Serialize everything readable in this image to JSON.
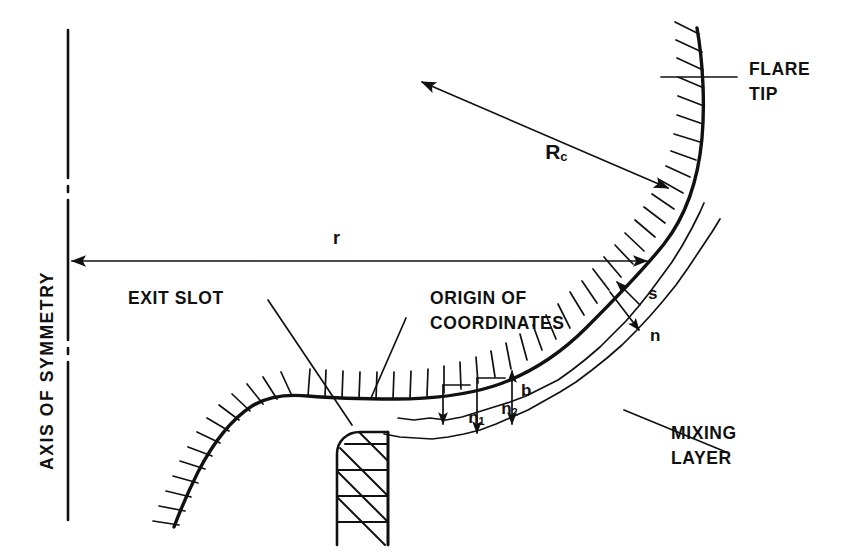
{
  "figure": {
    "kind": "engineering-schematic",
    "background_color": "#ffffff",
    "ink_color": "#111111"
  },
  "labels": {
    "axis_of_symmetry": "AXIS OF SYMMETRY",
    "flare_tip_line1": "FLARE",
    "flare_tip_line2": "TIP",
    "exit_slot": "EXIT SLOT",
    "origin_line1": "ORIGIN OF",
    "origin_line2": "COORDINATES",
    "mixing_layer_line1": "MIXING",
    "mixing_layer_line2": "LAYER",
    "radius_of_curvature": "R",
    "radius_of_curvature_subscript": "c",
    "radial_distance": "r",
    "streamwise_coordinate": "s",
    "normal_coordinate": "n",
    "n1": "n",
    "n1_subscript": "1",
    "n2": "n",
    "n2_subscript": "2",
    "mixing_layer_thickness": "b"
  },
  "geometry": {
    "axis_x": 68,
    "axis_top_y": 30,
    "axis_bottom_y": 520,
    "centerline_gaps": [
      [
        182,
        196
      ],
      [
        344,
        358
      ]
    ],
    "wall_profile": "M 697 28 C 703 62 705 104 702 138 C 698 182 686 216 664 244 C 640 274 612 302 586 328 C 560 354 530 374 494 386 C 462 396 430 399 396 399 C 360 399 330 398 308 396 C 286 394 268 396 252 406 C 232 419 213 443 198 472 C 188 492 180 511 174 527",
    "mixing_layer_upper": "M 398 418 C 432 419 466 415 498 405 C 530 394 562 376 592 352 C 622 327 648 297 668 268 C 684 245 696 222 703 206",
    "mixing_layer_lower": "M 386 434 C 412 437 440 438 468 434 C 500 429 532 417 562 400 C 596 381 626 357 652 331 C 678 305 700 277 716 252",
    "dimension_r_y": 261,
    "dimension_r_from_x": 68,
    "dimension_r_to_x": 651,
    "rc_arrow_from": [
      418,
      80
    ],
    "rc_arrow_to": [
      672,
      190
    ],
    "flare_tip_leader": [
      [
        661,
        77
      ],
      [
        735,
        77
      ]
    ],
    "exit_slot_leader": [
      [
        268,
        300
      ],
      [
        352,
        424
      ]
    ],
    "origin_leader": [
      [
        404,
        317
      ],
      [
        371,
        398
      ]
    ],
    "mixing_leader": [
      [
        627,
        412
      ],
      [
        727,
        451
      ]
    ],
    "nozzle_block": {
      "left": 334,
      "right": 388,
      "top": 432,
      "bottom": 545,
      "corner_radius": 20
    }
  },
  "annotations": [
    {
      "name": "flare-tip",
      "text": "FLARE TIP"
    },
    {
      "name": "exit-slot",
      "text": "EXIT SLOT"
    },
    {
      "name": "origin-of-coordinates",
      "text": "ORIGIN OF COORDINATES"
    },
    {
      "name": "mixing-layer",
      "text": "MIXING LAYER"
    },
    {
      "name": "radius-of-curvature",
      "text": "Rc"
    },
    {
      "name": "radial-distance",
      "text": "r"
    },
    {
      "name": "axis-of-symmetry",
      "text": "AXIS OF SYMMETRY"
    }
  ]
}
